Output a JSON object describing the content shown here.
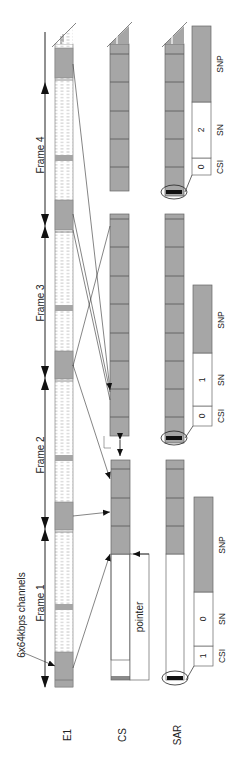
{
  "rows": {
    "e1": "E1",
    "cs": "CS",
    "sar": "SAR"
  },
  "channels_label": "6x64kbps channels",
  "frames": [
    {
      "label": "Frame 1"
    },
    {
      "label": "Frame 2"
    },
    {
      "label": "Frame 3"
    },
    {
      "label": "Frame 4"
    }
  ],
  "cs_pointer_label": "pointer",
  "sar_headers": [
    {
      "csi_label": "CSI",
      "csi_value": "1",
      "sn_label": "SN",
      "sn_value": "0",
      "snp_label": "SNP"
    },
    {
      "csi_label": "CSI",
      "csi_value": "0",
      "sn_label": "SN",
      "sn_value": "1",
      "snp_label": "SNP"
    },
    {
      "csi_label": "CSI",
      "csi_value": "0",
      "sn_label": "SN",
      "sn_value": "2",
      "snp_label": "SNP"
    }
  ],
  "colors": {
    "gray_fill": "#a6a6a6",
    "dark_line": "#555555",
    "black": "#111111"
  }
}
